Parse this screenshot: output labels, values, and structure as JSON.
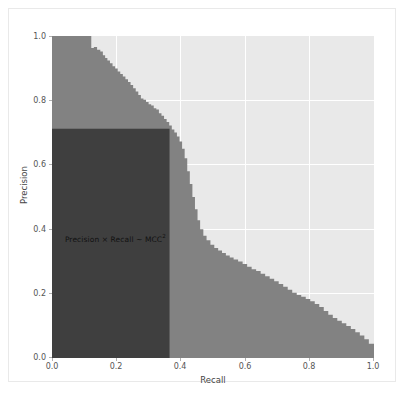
{
  "figure": {
    "background_color": "#ffffff",
    "frame_color": "#e9e9e9"
  },
  "chart_data": {
    "type": "area",
    "title": "",
    "xlabel": "Recall",
    "ylabel": "Precision",
    "xlim": [
      0.0,
      1.0
    ],
    "ylim": [
      0.0,
      1.0
    ],
    "grid": true,
    "grid_color": "#ffffff",
    "plot_background": "#e9e9e9",
    "legend": null,
    "xticks": [
      "0.0",
      "0.2",
      "0.4",
      "0.6",
      "0.8",
      "1.0"
    ],
    "yticks": [
      "0.0",
      "0.2",
      "0.4",
      "0.6",
      "0.8",
      "1.0"
    ],
    "xtick_values": [
      0.0,
      0.2,
      0.4,
      0.6,
      0.8,
      1.0
    ],
    "ytick_values": [
      0.0,
      0.2,
      0.4,
      0.6,
      0.8,
      1.0
    ],
    "series": [
      {
        "name": "Precision-Recall curve (step fill)",
        "fill_color": "#828282",
        "drawstyle": "steps-post",
        "x": [
          0.0,
          0.015,
          0.03,
          0.045,
          0.06,
          0.075,
          0.09,
          0.105,
          0.118,
          0.122,
          0.13,
          0.14,
          0.15,
          0.158,
          0.165,
          0.172,
          0.18,
          0.188,
          0.196,
          0.204,
          0.212,
          0.22,
          0.228,
          0.236,
          0.244,
          0.252,
          0.26,
          0.268,
          0.276,
          0.284,
          0.292,
          0.3,
          0.308,
          0.316,
          0.324,
          0.332,
          0.34,
          0.348,
          0.356,
          0.364,
          0.372,
          0.38,
          0.388,
          0.396,
          0.404,
          0.412,
          0.42,
          0.428,
          0.436,
          0.444,
          0.452,
          0.46,
          0.47,
          0.48,
          0.492,
          0.504,
          0.516,
          0.528,
          0.54,
          0.552,
          0.564,
          0.578,
          0.592,
          0.606,
          0.62,
          0.634,
          0.648,
          0.662,
          0.676,
          0.69,
          0.704,
          0.718,
          0.732,
          0.746,
          0.76,
          0.774,
          0.788,
          0.802,
          0.816,
          0.83,
          0.844,
          0.858,
          0.872,
          0.886,
          0.9,
          0.914,
          0.928,
          0.942,
          0.956,
          0.97,
          0.984,
          1.0
        ],
        "y": [
          1.0,
          1.0,
          1.0,
          1.0,
          1.0,
          1.0,
          1.0,
          1.0,
          1.0,
          0.963,
          0.966,
          0.957,
          0.952,
          0.94,
          0.932,
          0.924,
          0.915,
          0.906,
          0.899,
          0.89,
          0.882,
          0.874,
          0.866,
          0.857,
          0.848,
          0.838,
          0.828,
          0.817,
          0.806,
          0.802,
          0.795,
          0.788,
          0.784,
          0.776,
          0.772,
          0.76,
          0.752,
          0.742,
          0.733,
          0.722,
          0.71,
          0.7,
          0.688,
          0.672,
          0.65,
          0.62,
          0.58,
          0.54,
          0.5,
          0.462,
          0.428,
          0.4,
          0.38,
          0.366,
          0.352,
          0.342,
          0.334,
          0.326,
          0.318,
          0.312,
          0.306,
          0.3,
          0.292,
          0.283,
          0.276,
          0.27,
          0.262,
          0.254,
          0.246,
          0.238,
          0.23,
          0.221,
          0.212,
          0.203,
          0.196,
          0.19,
          0.183,
          0.176,
          0.168,
          0.158,
          0.146,
          0.134,
          0.124,
          0.116,
          0.108,
          0.099,
          0.09,
          0.08,
          0.07,
          0.058,
          0.044,
          0.018
        ]
      }
    ],
    "annotations": [
      {
        "name": "mcc-rectangle",
        "type": "rectangle",
        "x0": 0.0,
        "y0": 0.0,
        "x1": 0.365,
        "y1": 0.712,
        "fill_color": "#3f3f3f",
        "area": 0.26
      },
      {
        "name": "mcc-label",
        "type": "text",
        "text_prefix": "Precision × Recall ~ MCC",
        "text_superscript": "2",
        "x": 0.04,
        "y": 0.375,
        "color": "#111111"
      }
    ]
  }
}
